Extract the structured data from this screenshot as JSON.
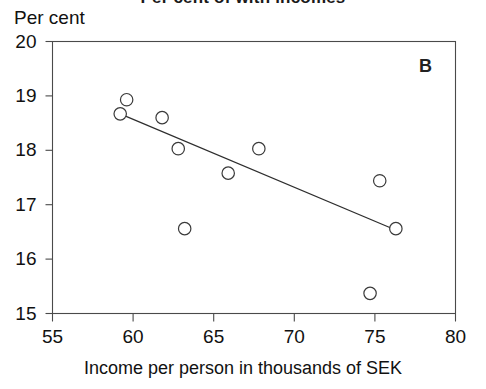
{
  "figure": {
    "title_clipped": "Per cent of with incomes",
    "panel_letter": "B",
    "y_axis_title": "Per cent",
    "x_axis_title": "Income per person in thousands of SEK"
  },
  "chart_data": {
    "type": "scatter",
    "title": "",
    "panel": "B",
    "xlabel": "Income per person in thousands of SEK",
    "ylabel": "Per cent",
    "xlim": [
      55,
      80
    ],
    "ylim": [
      15,
      20
    ],
    "xticks": [
      55,
      60,
      65,
      70,
      75,
      80
    ],
    "yticks": [
      15,
      16,
      17,
      18,
      19,
      20
    ],
    "xtick_labels": [
      "55",
      "60",
      "65",
      "70",
      "75",
      "80"
    ],
    "ytick_labels": [
      "15",
      "16",
      "17",
      "18",
      "19",
      "20"
    ],
    "grid": false,
    "legend": "none",
    "marker": "open-circle",
    "points": [
      {
        "x": 59.2,
        "y": 18.67
      },
      {
        "x": 59.6,
        "y": 18.93
      },
      {
        "x": 61.8,
        "y": 18.6
      },
      {
        "x": 62.8,
        "y": 18.03
      },
      {
        "x": 63.2,
        "y": 16.56
      },
      {
        "x": 65.9,
        "y": 17.58
      },
      {
        "x": 67.8,
        "y": 18.03
      },
      {
        "x": 74.7,
        "y": 15.37
      },
      {
        "x": 75.3,
        "y": 17.44
      },
      {
        "x": 76.3,
        "y": 16.56
      }
    ],
    "series": [
      {
        "name": "Observations",
        "type": "scatter",
        "x": [
          59.2,
          59.6,
          61.8,
          62.8,
          63.2,
          65.9,
          67.8,
          74.7,
          75.3,
          76.3
        ],
        "values": [
          18.67,
          18.93,
          18.6,
          18.03,
          16.56,
          17.58,
          18.03,
          15.37,
          17.44,
          16.56
        ]
      },
      {
        "name": "Fitted regression line",
        "type": "line",
        "x": [
          59.2,
          76.4
        ],
        "values": [
          18.67,
          16.52
        ]
      }
    ],
    "trendline": {
      "x_start": 59.2,
      "y_start": 18.67,
      "x_end": 76.4,
      "y_end": 16.52,
      "slope": -0.125,
      "intercept": 26.07
    }
  }
}
